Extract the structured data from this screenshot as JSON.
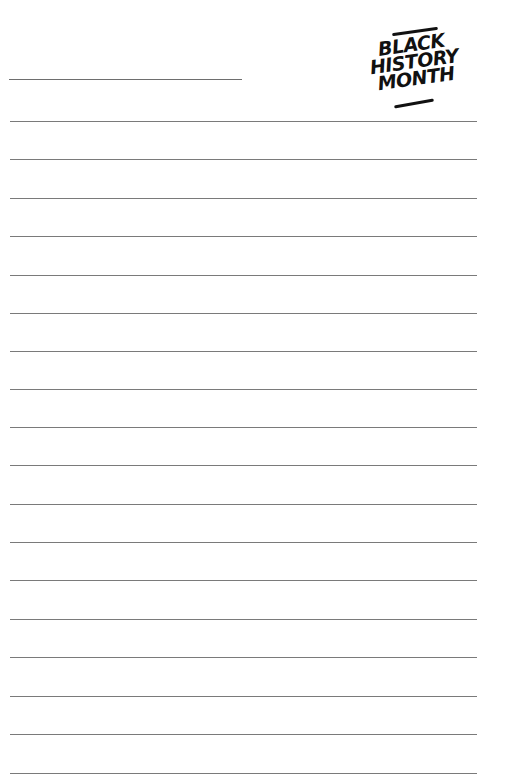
{
  "logo": {
    "lines": [
      "BLACK",
      "HISTORY",
      "MONTH"
    ]
  },
  "page": {
    "type": "lined-writing-paper",
    "name_line": true,
    "ruled_line_count": 18,
    "ruled_line_tops": [
      121,
      159,
      198,
      236,
      275,
      313,
      351,
      389,
      427,
      465,
      504,
      542,
      580,
      619,
      657,
      696,
      734,
      773
    ],
    "line_color": "#7a7a7a"
  }
}
